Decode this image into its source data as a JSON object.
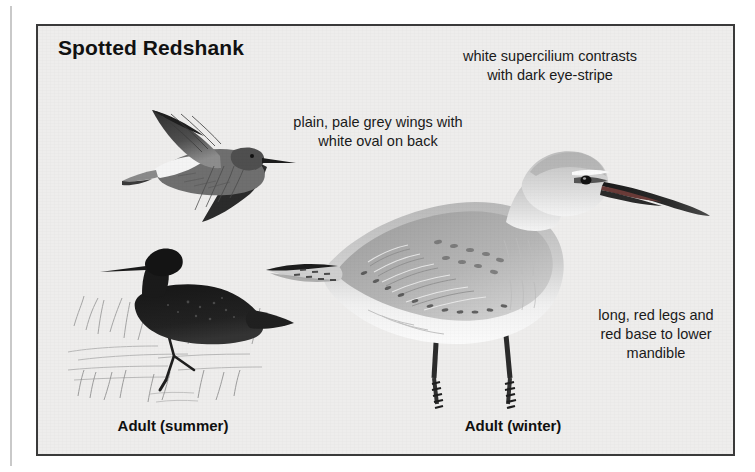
{
  "plate": {
    "title": "Spotted Redshank",
    "background_color": "#eeedec",
    "border_color": "#3a3a3a",
    "page_color": "#ffffff"
  },
  "annotations": [
    {
      "id": "supercilium",
      "line1": "white supercilium contrasts",
      "line2": "with dark eye-stripe",
      "line3": ""
    },
    {
      "id": "wings",
      "line1": "plain, pale grey wings with",
      "line2": "white oval on back",
      "line3": ""
    },
    {
      "id": "legs",
      "line1": "long, red legs and",
      "line2": "red base to lower",
      "line3": "mandible"
    }
  ],
  "figures": [
    {
      "id": "flight",
      "caption": "",
      "icon": "bird-in-flight-icon",
      "description": "dark upper wings with white oval on back"
    },
    {
      "id": "summer",
      "caption": "Adult (summer)",
      "icon": "bird-standing-black-icon",
      "description": "all-black breeding plumage, wading in marsh grass"
    },
    {
      "id": "winter",
      "caption": "Adult (winter)",
      "icon": "bird-standing-grey-icon",
      "description": "pale grey winter plumage, long red legs, long dark bill"
    }
  ],
  "colors": {
    "plumage_dark": "#1b1b1b",
    "plumage_grey": "#a8a8a8",
    "plumage_pale": "#f2f2f2",
    "leg_dark": "#262626",
    "grass": "#8e8e8e",
    "text": "#1a1a1a"
  }
}
